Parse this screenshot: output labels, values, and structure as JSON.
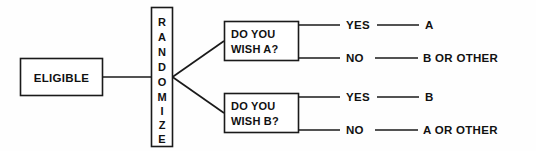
{
  "diagram": {
    "colors": {
      "background": "#fefefe",
      "stroke": "#1a1a1a",
      "text": "#111111",
      "box_fill": "#ffffff"
    },
    "entry_node": {
      "label": "ELIGIBLE"
    },
    "randomize_node": {
      "label": "RANDOMIZE",
      "orientation": "vertical",
      "letters": [
        "R",
        "A",
        "N",
        "D",
        "O",
        "M",
        "I",
        "Z",
        "E"
      ]
    },
    "decisions": [
      {
        "id": "wish-a",
        "line1": "DO YOU",
        "line2": "WISH A?",
        "branches": [
          {
            "condition": "YES",
            "outcome": "A"
          },
          {
            "condition": "NO",
            "outcome": "B  OR  OTHER"
          }
        ]
      },
      {
        "id": "wish-b",
        "line1": "DO YOU",
        "line2": "WISH B?",
        "branches": [
          {
            "condition": "YES",
            "outcome": "B"
          },
          {
            "condition": "NO",
            "outcome": "A  OR  OTHER"
          }
        ]
      }
    ]
  }
}
